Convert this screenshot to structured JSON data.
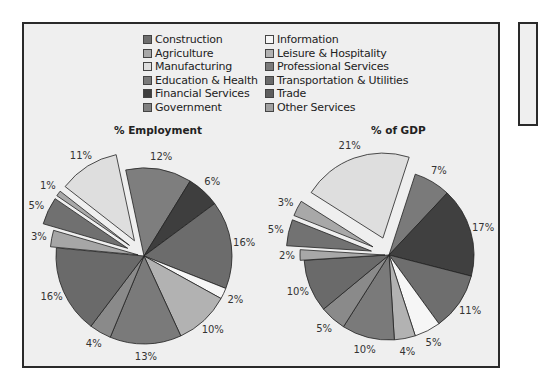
{
  "chart_data": [
    {
      "type": "pie",
      "title": "% Employment",
      "center": [
        144,
        256
      ],
      "radius": 88,
      "start_angle_deg": -12,
      "slices": [
        {
          "label": "12%",
          "category": "Government",
          "value": 12,
          "color": "#7e7e7e"
        },
        {
          "label": "6%",
          "category": "Financial Services",
          "value": 6,
          "color": "#3e3e3e"
        },
        {
          "label": "16%",
          "category": "Trade",
          "value": 16,
          "color": "#6c6c6c"
        },
        {
          "label": "2%",
          "category": "Information",
          "value": 2,
          "color": "#f6f6f6"
        },
        {
          "label": "10%",
          "category": "Leisure & Hospitality",
          "value": 10,
          "color": "#b2b2b2"
        },
        {
          "label": "13%",
          "category": "Education & Health",
          "value": 13,
          "color": "#7a7a7a"
        },
        {
          "label": "4%",
          "category": "Other Services",
          "value": 4,
          "color": "#8a8a8a"
        },
        {
          "label": "16%",
          "category": "Professional Services",
          "value": 16,
          "color": "#6a6a6a"
        },
        {
          "label": "3%",
          "category": "Agriculture",
          "value": 3,
          "color": "#a6a6a6",
          "offset": 6
        },
        {
          "label": "5%",
          "category": "Construction",
          "value": 5,
          "color": "#707070",
          "offset": 18
        },
        {
          "label": "1%",
          "category": "Agriculture",
          "value": 1,
          "color": "#a8a8a8",
          "offset": 18
        },
        {
          "label": "11%",
          "category": "Manufacturing",
          "value": 11,
          "color": "#dedede",
          "offset": 18
        }
      ]
    },
    {
      "type": "pie",
      "title": "% of GDP",
      "center": [
        389,
        255
      ],
      "radius": 85,
      "start_angle_deg": 18,
      "slices": [
        {
          "label": "7%",
          "category": "Professional Services",
          "value": 7,
          "color": "#7a7a7a"
        },
        {
          "label": "17%",
          "category": "Financial Services",
          "value": 17,
          "color": "#404040"
        },
        {
          "label": "11%",
          "category": "Trade",
          "value": 11,
          "color": "#6e6e6e"
        },
        {
          "label": "5%",
          "category": "Information",
          "value": 5,
          "color": "#f6f6f6"
        },
        {
          "label": "4%",
          "category": "Leisure & Hospitality",
          "value": 4,
          "color": "#b2b2b2"
        },
        {
          "label": "10%",
          "category": "Education & Health",
          "value": 10,
          "color": "#7a7a7a"
        },
        {
          "label": "5%",
          "category": "Other Services",
          "value": 5,
          "color": "#8a8a8a"
        },
        {
          "label": "10%",
          "category": "Government",
          "value": 10,
          "color": "#6a6a6a"
        },
        {
          "label": "2%",
          "category": "Agriculture",
          "value": 2,
          "color": "#a8a8a8",
          "offset": 4
        },
        {
          "label": "5%",
          "category": "Construction",
          "value": 5,
          "color": "#727272",
          "offset": 18
        },
        {
          "label": "3%",
          "category": "Agriculture",
          "value": 3,
          "color": "#a8a8a8",
          "offset": 18
        },
        {
          "label": "21%",
          "category": "Manufacturing",
          "value": 21,
          "color": "#dedede",
          "offset": 18
        }
      ]
    }
  ],
  "legend": {
    "items": [
      {
        "label": "Construction",
        "color": "#6e6e6e"
      },
      {
        "label": "Information",
        "color": "#f6f6f6"
      },
      {
        "label": "Agriculture",
        "color": "#a8a8a8"
      },
      {
        "label": "Leisure & Hospitality",
        "color": "#b2b2b2"
      },
      {
        "label": "Manufacturing",
        "color": "#dedede"
      },
      {
        "label": "Professional Services",
        "color": "#7a7a7a"
      },
      {
        "label": "Education & Health",
        "color": "#7a7a7a"
      },
      {
        "label": "Transportation & Utilities",
        "color": "#6a6a6a"
      },
      {
        "label": "Financial Services",
        "color": "#3e3e3e"
      },
      {
        "label": "Trade",
        "color": "#5e5e5e"
      },
      {
        "label": "Government",
        "color": "#808080"
      },
      {
        "label": "Other Services",
        "color": "#a0a0a0"
      }
    ]
  },
  "titles": {
    "employment": "% Employment",
    "gdp": "% of GDP"
  }
}
